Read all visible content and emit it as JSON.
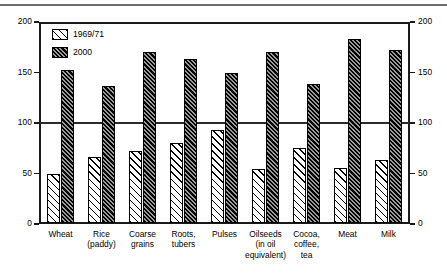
{
  "chart_data": {
    "type": "bar",
    "title": "",
    "subtitle": "",
    "xlabel": "",
    "ylabel": "",
    "ylim": [
      0,
      200
    ],
    "yticks": [
      0,
      50,
      100,
      150,
      200
    ],
    "grid": "horizontal line at 100 only",
    "legend_position": "inside top-left",
    "dual_axis": true,
    "right_axis_ticks": [
      0,
      50,
      100,
      150,
      200
    ],
    "categories": [
      "Wheat",
      "Rice\n(paddy)",
      "Coarse\ngrains",
      "Roots,\ntubers",
      "Pulses",
      "Oilseeds\n(in oil\nequivalent)",
      "Cocoa,\ncoffee,\ntea",
      "Meat",
      "Milk"
    ],
    "series": [
      {
        "name": "1969/71",
        "pattern": "light-diagonal-hatch",
        "values": [
          48,
          65,
          71,
          79,
          92,
          53,
          74,
          54,
          62
        ]
      },
      {
        "name": "2000",
        "pattern": "dark-dense-hatch",
        "values": [
          151,
          135,
          169,
          162,
          148,
          169,
          137,
          182,
          171
        ]
      }
    ],
    "annotations": []
  },
  "axes": {
    "left_tick_labels": [
      "0",
      "50",
      "100",
      "150",
      "200"
    ],
    "right_tick_labels": [
      "0",
      "50",
      "100",
      "150",
      "200"
    ]
  },
  "legend": {
    "items": [
      {
        "label": "1969/71"
      },
      {
        "label": "2000"
      }
    ]
  },
  "colors": {
    "axis": "#1a1a1a",
    "gridline": "#2a2a2a",
    "series_1969_71": "#ffffff",
    "series_2000": "#3a3a3a",
    "top_rule": "#6e6e6e",
    "background": "#ffffff"
  }
}
